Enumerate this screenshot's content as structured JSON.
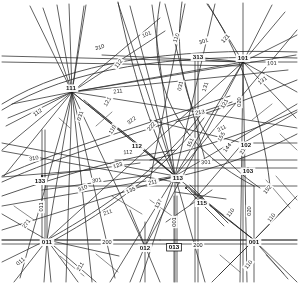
{
  "figure": {
    "kind": "line-arrangement-diagram",
    "caption": "",
    "background_color": "#ffffff",
    "ink_color": "#2b2b2b",
    "width": 298,
    "height": 283,
    "highlighted_label": "013"
  },
  "nodes": [
    {
      "id": "n-111",
      "label": "111",
      "x": 72,
      "y": 92,
      "anchor": "middle",
      "dx": -1,
      "dy": -3
    },
    {
      "id": "n-101",
      "label": "101",
      "x": 243,
      "y": 62,
      "anchor": "middle",
      "dx": 0,
      "dy": -3
    },
    {
      "id": "n-113",
      "label": "113",
      "x": 175,
      "y": 176,
      "anchor": "start",
      "dx": 3,
      "dy": 3
    },
    {
      "id": "n-011",
      "label": "011",
      "x": 47,
      "y": 240,
      "anchor": "middle",
      "dx": 0,
      "dy": 3
    },
    {
      "id": "n-001",
      "label": "001",
      "x": 254,
      "y": 240,
      "anchor": "middle",
      "dx": 0,
      "dy": 3
    },
    {
      "id": "n-133",
      "label": "133",
      "x": 42,
      "y": 176,
      "anchor": "middle",
      "dx": -2,
      "dy": 6
    },
    {
      "id": "n-102",
      "label": "102",
      "x": 243,
      "y": 143,
      "anchor": "start",
      "dx": 3,
      "dy": 3
    },
    {
      "id": "n-313",
      "label": "313",
      "x": 195,
      "y": 57,
      "anchor": "start",
      "dx": 3,
      "dy": 1
    },
    {
      "id": "n-112",
      "label": "112",
      "x": 139,
      "y": 145,
      "anchor": "end",
      "dx": -2,
      "dy": 2
    },
    {
      "id": "n-115",
      "label": "115",
      "x": 200,
      "y": 203,
      "anchor": "start",
      "dx": 2,
      "dy": 1
    },
    {
      "id": "n-103",
      "label": "103",
      "x": 248,
      "y": 168,
      "anchor": "middle",
      "dx": 0,
      "dy": 4
    },
    {
      "id": "n-012",
      "label": "012",
      "x": 145,
      "y": 247,
      "anchor": "middle",
      "dx": 0,
      "dy": 2
    },
    {
      "id": "n-013",
      "label": "013",
      "x": 174,
      "y": 246,
      "anchor": "middle",
      "dx": 0,
      "dy": 2
    }
  ],
  "edge_labels": [
    {
      "id": "e-101a",
      "label": "101",
      "x": 147,
      "y": 35,
      "rotate": -22
    },
    {
      "id": "e-101b",
      "label": "101",
      "x": 272,
      "y": 64,
      "rotate": -4
    },
    {
      "id": "e-112a",
      "label": "112",
      "x": 119,
      "y": 64,
      "rotate": -52
    },
    {
      "id": "e-112b",
      "label": "112",
      "x": 38,
      "y": 113,
      "rotate": -34
    },
    {
      "id": "e-211a",
      "label": "211",
      "x": 118,
      "y": 92,
      "rotate": -5
    },
    {
      "id": "e-211b",
      "label": "211",
      "x": 153,
      "y": 183,
      "rotate": -13
    },
    {
      "id": "e-211c",
      "label": "211",
      "x": 108,
      "y": 213,
      "rotate": -20
    },
    {
      "id": "e-211d",
      "label": "211",
      "x": 222,
      "y": 129,
      "rotate": -28
    },
    {
      "id": "e-110a",
      "label": "110",
      "x": 177,
      "y": 38,
      "rotate": -70
    },
    {
      "id": "e-110b",
      "label": "110",
      "x": 113,
      "y": 130,
      "rotate": -58
    },
    {
      "id": "e-110c",
      "label": "110",
      "x": 231,
      "y": 213,
      "rotate": -52
    },
    {
      "id": "e-110d",
      "label": "110",
      "x": 272,
      "y": 218,
      "rotate": -52
    },
    {
      "id": "e-110e",
      "label": "110",
      "x": 249,
      "y": 265,
      "rotate": -52
    },
    {
      "id": "e-031a",
      "label": "031",
      "x": 181,
      "y": 86,
      "rotate": -78
    },
    {
      "id": "e-031b",
      "label": "031",
      "x": 81,
      "y": 116,
      "rotate": -72
    },
    {
      "id": "e-131a",
      "label": "131",
      "x": 206,
      "y": 87,
      "rotate": -72
    },
    {
      "id": "e-131b",
      "label": "131",
      "x": 263,
      "y": 81,
      "rotate": -38
    },
    {
      "id": "e-121a",
      "label": "121",
      "x": 226,
      "y": 39,
      "rotate": -48
    },
    {
      "id": "e-121b",
      "label": "121",
      "x": 225,
      "y": 104,
      "rotate": -62
    },
    {
      "id": "e-121c",
      "label": "121",
      "x": 108,
      "y": 102,
      "rotate": -60
    },
    {
      "id": "e-020a",
      "label": "020",
      "x": 240,
      "y": 102,
      "rotate": -90
    },
    {
      "id": "e-020b",
      "label": "020",
      "x": 250,
      "y": 211,
      "rotate": -90
    },
    {
      "id": "e-310a",
      "label": "310",
      "x": 100,
      "y": 48,
      "rotate": -16
    },
    {
      "id": "e-310b",
      "label": "310",
      "x": 34,
      "y": 159,
      "rotate": -10
    },
    {
      "id": "e-310c",
      "label": "310",
      "x": 83,
      "y": 189,
      "rotate": -24
    },
    {
      "id": "e-301a",
      "label": "301",
      "x": 97,
      "y": 181,
      "rotate": -10
    },
    {
      "id": "e-301b",
      "label": "301",
      "x": 206,
      "y": 163,
      "rotate": -4
    },
    {
      "id": "e-301c",
      "label": "301",
      "x": 204,
      "y": 42,
      "rotate": -20
    },
    {
      "id": "e-213",
      "label": "213",
      "x": 200,
      "y": 113,
      "rotate": -9
    },
    {
      "id": "e-222",
      "label": "222",
      "x": 152,
      "y": 127,
      "rotate": -50
    },
    {
      "id": "e-322",
      "label": "322",
      "x": 132,
      "y": 121,
      "rotate": -36
    },
    {
      "id": "e-123",
      "label": "123",
      "x": 118,
      "y": 166,
      "rotate": -18
    },
    {
      "id": "e-135",
      "label": "135",
      "x": 131,
      "y": 191,
      "rotate": -24
    },
    {
      "id": "e-137",
      "label": "137",
      "x": 159,
      "y": 204,
      "rotate": -62
    },
    {
      "id": "e-151",
      "label": "151",
      "x": 191,
      "y": 143,
      "rotate": -64
    },
    {
      "id": "e-155",
      "label": "155",
      "x": 222,
      "y": 137,
      "rotate": -60
    },
    {
      "id": "e-144",
      "label": "144",
      "x": 228,
      "y": 148,
      "rotate": -52
    },
    {
      "id": "e-152",
      "label": "152",
      "x": 268,
      "y": 190,
      "rotate": -50
    },
    {
      "id": "e-214",
      "label": "214",
      "x": 244,
      "y": 150,
      "rotate": -60
    },
    {
      "id": "e-200a",
      "label": "200",
      "x": 107,
      "y": 243,
      "rotate": 0
    },
    {
      "id": "e-200b",
      "label": "200",
      "x": 198,
      "y": 246,
      "rotate": 0
    },
    {
      "id": "e-001v",
      "label": "001",
      "x": 175,
      "y": 222,
      "rotate": -90
    },
    {
      "id": "e-011v",
      "label": "011",
      "x": 42,
      "y": 207,
      "rotate": -90
    },
    {
      "id": "e-112c",
      "label": "112",
      "x": 128,
      "y": 153,
      "rotate": -4
    },
    {
      "id": "e-211e",
      "label": "211",
      "x": 81,
      "y": 267,
      "rotate": -58
    },
    {
      "id": "e-271",
      "label": "271",
      "x": 27,
      "y": 224,
      "rotate": -54
    },
    {
      "id": "e-133",
      "label": "133",
      "x": 40,
      "y": 182,
      "rotate": 0
    },
    {
      "id": "e-011b",
      "label": "011",
      "x": 21,
      "y": 262,
      "rotate": -40
    }
  ],
  "strokes": {
    "line_color": "#2b2b2b",
    "arc_color": "#2b2b2b"
  }
}
